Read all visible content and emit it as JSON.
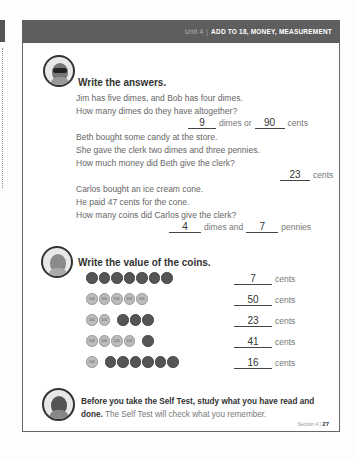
{
  "header": {
    "unit": "Unit 4",
    "title": "ADD TO 18, MONEY, MEASUREMENT"
  },
  "section1": {
    "title": "Write the answers.",
    "problems": [
      {
        "lines": [
          "Jim has five dimes, and Bob has four dimes.",
          "How many dimes do they have altogether?"
        ],
        "answer_a": "9",
        "label_a": "dimes or",
        "answer_b": "90",
        "label_b": "cents"
      },
      {
        "lines": [
          "Beth bought some candy at the store.",
          "She gave the clerk two dimes and three pennies.",
          "How much money did Beth give the clerk?"
        ],
        "answer_a": "23",
        "label_a": "cents"
      },
      {
        "lines": [
          "Carlos bought an ice cream cone.",
          "He paid 47 cents for the cone.",
          "How many coins did Carlos give the clerk?"
        ],
        "answer_a": "4",
        "label_a": "dimes and",
        "answer_b": "7",
        "label_b": "pennies"
      }
    ]
  },
  "section2": {
    "title": "Write the value of the coins.",
    "dime_label": "10¢",
    "penny_label": "1¢",
    "unit_label": "cents",
    "rows": [
      {
        "dimes": 0,
        "pennies": 7,
        "answer": "7"
      },
      {
        "dimes": 5,
        "pennies": 0,
        "answer": "50"
      },
      {
        "dimes": 2,
        "pennies": 3,
        "answer": "23"
      },
      {
        "dimes": 4,
        "pennies": 1,
        "answer": "41"
      },
      {
        "dimes": 1,
        "pennies": 6,
        "answer": "16"
      }
    ]
  },
  "footer": {
    "bold_text": "Before you take the Self Test, study what you have read and done.",
    "normal_text": " The Self Test will check what you remember.",
    "section_label": "Section 4",
    "page_number": "27"
  }
}
